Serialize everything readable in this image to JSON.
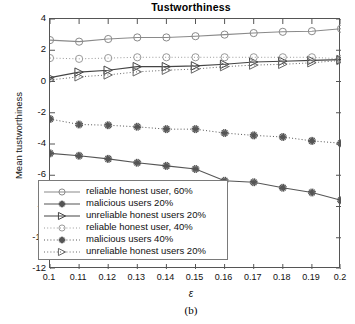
{
  "figure": {
    "caption": "(b)",
    "background": "#ffffff"
  },
  "chart_data": {
    "type": "line",
    "title": "Tustworthiness",
    "xlabel": "ε",
    "ylabel": "Mean tustworthiness",
    "grid": false,
    "legend_position": "lower-left-inside",
    "xlim": [
      0.1,
      0.2
    ],
    "ylim": [
      -12,
      4
    ],
    "yticks": [
      4,
      2,
      0,
      -2,
      -4,
      -6,
      -8,
      -10,
      -12
    ],
    "ytick_labels": [
      "4",
      "2",
      "0",
      "-2",
      "-4",
      "-6",
      "-8",
      "-10",
      "-12"
    ],
    "x": [
      0.1,
      0.11,
      0.12,
      0.13,
      0.14,
      0.15,
      0.16,
      0.17,
      0.18,
      0.19,
      0.2
    ],
    "xtick_labels": [
      "0.1",
      "0.11",
      "0.12",
      "0.13",
      "0.14",
      "0.15",
      "0.16",
      "0.17",
      "0.18",
      "0.19",
      "0.2"
    ],
    "series": [
      {
        "name": "reliable honest user, 60%",
        "marker": "circle",
        "linestyle": "solid",
        "color": "#8a8a8a",
        "values": [
          2.65,
          2.55,
          2.72,
          2.82,
          2.82,
          2.9,
          3.0,
          3.1,
          3.18,
          3.22,
          3.38
        ]
      },
      {
        "name": "malicious users 20%",
        "marker": "asterisk",
        "linestyle": "solid",
        "color": "#555555",
        "values": [
          -4.6,
          -4.75,
          -4.95,
          -5.2,
          -5.4,
          -5.6,
          -6.35,
          -6.45,
          -6.8,
          -7.1,
          -7.6
        ]
      },
      {
        "name": "unreliable honest users 20%",
        "marker": "triangle-right",
        "linestyle": "solid",
        "color": "#444444",
        "values": [
          0.25,
          0.6,
          0.72,
          0.95,
          0.95,
          1.0,
          1.1,
          1.25,
          1.3,
          1.35,
          1.4
        ]
      },
      {
        "name": "reliable honest user, 40%",
        "marker": "circle",
        "linestyle": "dotted",
        "color": "#9a9a9a",
        "values": [
          1.5,
          1.45,
          1.5,
          1.55,
          1.55,
          1.55,
          1.55,
          1.55,
          1.55,
          1.55,
          1.45
        ]
      },
      {
        "name": "malicious users 40%",
        "marker": "asterisk",
        "linestyle": "dotted",
        "color": "#555555",
        "values": [
          -2.4,
          -2.75,
          -2.8,
          -2.9,
          -3.05,
          -3.05,
          -3.3,
          -3.45,
          -3.55,
          -3.8,
          -3.95
        ]
      },
      {
        "name": "unreliable honest users 20%",
        "marker": "triangle-right",
        "linestyle": "dotted",
        "color": "#666666",
        "values": [
          0.1,
          0.3,
          0.42,
          0.62,
          0.72,
          0.8,
          0.95,
          1.05,
          1.1,
          1.2,
          1.35
        ]
      }
    ]
  }
}
